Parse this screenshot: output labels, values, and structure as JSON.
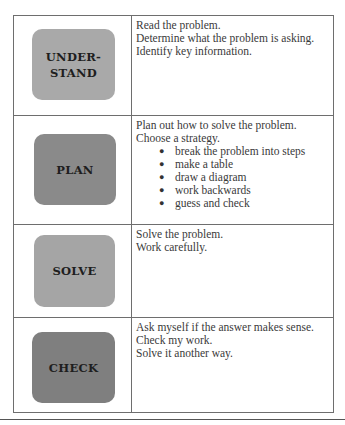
{
  "steps": [
    {
      "label": "UNDER-\nSTAND",
      "color": "#a9a9a9",
      "lines": [
        "Read the problem.",
        "Determine what the problem is asking.",
        "Identify key information."
      ],
      "bullets": []
    },
    {
      "label": "PLAN",
      "color": "#8a8a8a",
      "lines": [
        "Plan out how to solve the problem.",
        "Choose a strategy."
      ],
      "bullets": [
        "break the problem into steps",
        "make a table",
        "draw a diagram",
        "work backwards",
        "guess and check"
      ]
    },
    {
      "label": "SOLVE",
      "color": "#a5a5a5",
      "lines": [
        "Solve the problem.",
        "Work carefully."
      ],
      "bullets": []
    },
    {
      "label": "CHECK",
      "color": "#7f7f7f",
      "lines": [
        "Ask myself if the answer makes sense.",
        "Check my work.",
        "Solve it another way."
      ],
      "bullets": []
    }
  ],
  "bullet_glyph": "●"
}
